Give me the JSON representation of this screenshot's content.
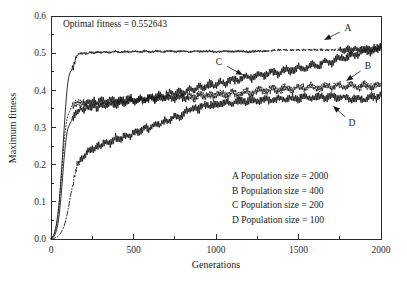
{
  "chart_data": {
    "type": "line",
    "title": "",
    "xlabel": "Generations",
    "ylabel": "Maximum fitness",
    "xlim": [
      0,
      2000
    ],
    "ylim": [
      0.0,
      0.6
    ],
    "grid": false,
    "legend_position": "inside-lower-right",
    "xticks": [
      0,
      500,
      1000,
      1500,
      2000
    ],
    "xtick_labels": [
      "0",
      "500",
      "1000",
      "1500",
      "2000"
    ],
    "xminor_step": 250,
    "yticks": [
      0.0,
      0.1,
      0.2,
      0.3,
      0.4,
      0.5,
      0.6
    ],
    "ytick_labels": [
      "0.0",
      "0.1",
      "0.2",
      "0.3",
      "0.4",
      "0.5",
      "0.6"
    ],
    "yminor_step": 0.05,
    "annotations": [
      {
        "name": "optimal-fitness-note",
        "text": "Optimal fitness = 0.552643",
        "x": 120,
        "y": 0.575
      }
    ],
    "series": [
      {
        "name": "A",
        "label": "A Population size = 2000",
        "population_size": 2000,
        "linestyle": "solid-then-dashed",
        "color": "#1a1a1a",
        "final_value": 0.515,
        "plateau_value": 0.505,
        "x": [
          0,
          10,
          20,
          30,
          40,
          50,
          60,
          70,
          80,
          90,
          100,
          110,
          120,
          130,
          140,
          150,
          160,
          170,
          180,
          200,
          220,
          240,
          260,
          280,
          300,
          330,
          360,
          390,
          420,
          450,
          480,
          510,
          540,
          570,
          600,
          640,
          680,
          720,
          760,
          800,
          840,
          880,
          920,
          960,
          1000,
          1050,
          1100,
          1150,
          1200,
          1250,
          1300,
          1350,
          1400,
          1450,
          1500,
          1550,
          1600,
          1650,
          1700,
          1750,
          1780,
          1800,
          1820,
          1840,
          1860,
          1880,
          1900,
          1920,
          1940,
          1960,
          1980,
          2000
        ],
        "y": [
          0.002,
          0.006,
          0.015,
          0.032,
          0.06,
          0.1,
          0.16,
          0.225,
          0.3,
          0.365,
          0.415,
          0.442,
          0.452,
          0.455,
          0.47,
          0.487,
          0.494,
          0.498,
          0.5,
          0.5,
          0.498,
          0.503,
          0.5,
          0.504,
          0.501,
          0.504,
          0.502,
          0.505,
          0.502,
          0.505,
          0.503,
          0.505,
          0.503,
          0.506,
          0.503,
          0.506,
          0.503,
          0.506,
          0.504,
          0.506,
          0.503,
          0.506,
          0.504,
          0.506,
          0.503,
          0.506,
          0.504,
          0.506,
          0.503,
          0.506,
          0.505,
          0.508,
          0.509,
          0.509,
          0.509,
          0.509,
          0.509,
          0.509,
          0.509,
          0.509,
          0.507,
          0.512,
          0.506,
          0.514,
          0.507,
          0.515,
          0.508,
          0.516,
          0.509,
          0.517,
          0.509,
          0.516
        ]
      },
      {
        "name": "B",
        "label": "B Population size = 400",
        "population_size": 400,
        "linestyle": "dotted-dashdot",
        "color": "#1a1a1a",
        "final_value": 0.412,
        "x": [
          0,
          10,
          20,
          30,
          40,
          50,
          60,
          70,
          80,
          90,
          100,
          120,
          140,
          160,
          180,
          200,
          220,
          240,
          260,
          280,
          300,
          330,
          360,
          390,
          420,
          450,
          480,
          510,
          540,
          570,
          600,
          630,
          660,
          690,
          720,
          750,
          780,
          810,
          840,
          870,
          900,
          930,
          960,
          990,
          1020,
          1060,
          1100,
          1140,
          1180,
          1220,
          1260,
          1300,
          1340,
          1380,
          1420,
          1460,
          1500,
          1540,
          1580,
          1620,
          1660,
          1700,
          1740,
          1780,
          1820,
          1860,
          1900,
          1940,
          1970,
          2000
        ],
        "y": [
          0.001,
          0.004,
          0.012,
          0.028,
          0.055,
          0.095,
          0.15,
          0.21,
          0.265,
          0.305,
          0.33,
          0.352,
          0.362,
          0.365,
          0.368,
          0.362,
          0.372,
          0.365,
          0.374,
          0.366,
          0.375,
          0.368,
          0.376,
          0.369,
          0.378,
          0.37,
          0.379,
          0.371,
          0.38,
          0.372,
          0.382,
          0.372,
          0.383,
          0.374,
          0.384,
          0.375,
          0.386,
          0.376,
          0.388,
          0.378,
          0.39,
          0.379,
          0.392,
          0.382,
          0.394,
          0.384,
          0.396,
          0.386,
          0.4,
          0.39,
          0.404,
          0.394,
          0.407,
          0.397,
          0.41,
          0.4,
          0.412,
          0.402,
          0.414,
          0.403,
          0.415,
          0.404,
          0.416,
          0.405,
          0.417,
          0.406,
          0.418,
          0.406,
          0.416,
          0.412
        ]
      },
      {
        "name": "C",
        "label": "C Population size = 200",
        "population_size": 200,
        "linestyle": "solid",
        "color": "#1a1a1a",
        "final_value": 0.518,
        "x": [
          0,
          10,
          20,
          30,
          40,
          50,
          60,
          70,
          80,
          90,
          100,
          120,
          140,
          160,
          180,
          200,
          220,
          240,
          260,
          280,
          300,
          330,
          360,
          390,
          420,
          450,
          480,
          510,
          540,
          570,
          600,
          630,
          660,
          690,
          720,
          750,
          780,
          810,
          840,
          870,
          900,
          930,
          960,
          990,
          1020,
          1060,
          1100,
          1140,
          1180,
          1220,
          1260,
          1300,
          1340,
          1380,
          1420,
          1460,
          1500,
          1540,
          1580,
          1620,
          1660,
          1700,
          1740,
          1780,
          1820,
          1860,
          1900,
          1940,
          1970,
          2000
        ],
        "y": [
          0.001,
          0.003,
          0.008,
          0.018,
          0.035,
          0.065,
          0.11,
          0.165,
          0.22,
          0.265,
          0.295,
          0.315,
          0.33,
          0.342,
          0.35,
          0.345,
          0.356,
          0.35,
          0.36,
          0.352,
          0.362,
          0.356,
          0.366,
          0.358,
          0.37,
          0.362,
          0.374,
          0.366,
          0.378,
          0.37,
          0.384,
          0.376,
          0.39,
          0.382,
          0.396,
          0.388,
          0.4,
          0.392,
          0.406,
          0.398,
          0.412,
          0.404,
          0.418,
          0.41,
          0.424,
          0.416,
          0.432,
          0.424,
          0.44,
          0.43,
          0.446,
          0.438,
          0.452,
          0.444,
          0.458,
          0.45,
          0.464,
          0.456,
          0.472,
          0.464,
          0.48,
          0.472,
          0.49,
          0.484,
          0.5,
          0.494,
          0.508,
          0.5,
          0.512,
          0.518
        ]
      },
      {
        "name": "D",
        "label": "D Population size = 100",
        "population_size": 100,
        "linestyle": "dashdot",
        "color": "#1a1a1a",
        "final_value": 0.392,
        "x": [
          0,
          20,
          40,
          60,
          80,
          100,
          120,
          140,
          160,
          180,
          200,
          220,
          240,
          260,
          280,
          300,
          330,
          360,
          390,
          420,
          450,
          480,
          510,
          540,
          570,
          600,
          630,
          660,
          690,
          720,
          750,
          780,
          810,
          840,
          870,
          900,
          930,
          960,
          990,
          1020,
          1060,
          1100,
          1140,
          1180,
          1220,
          1260,
          1300,
          1340,
          1380,
          1420,
          1460,
          1500,
          1540,
          1580,
          1620,
          1660,
          1700,
          1740,
          1780,
          1820,
          1860,
          1900,
          1940,
          1970,
          2000
        ],
        "y": [
          0.0,
          0.002,
          0.006,
          0.016,
          0.035,
          0.07,
          0.12,
          0.165,
          0.2,
          0.212,
          0.222,
          0.232,
          0.244,
          0.24,
          0.254,
          0.248,
          0.262,
          0.256,
          0.272,
          0.266,
          0.282,
          0.276,
          0.292,
          0.286,
          0.302,
          0.296,
          0.312,
          0.306,
          0.322,
          0.316,
          0.332,
          0.326,
          0.342,
          0.348,
          0.354,
          0.35,
          0.362,
          0.356,
          0.366,
          0.36,
          0.37,
          0.364,
          0.374,
          0.368,
          0.376,
          0.37,
          0.378,
          0.372,
          0.38,
          0.374,
          0.382,
          0.376,
          0.384,
          0.377,
          0.385,
          0.378,
          0.386,
          0.378,
          0.384,
          0.374,
          0.382,
          0.372,
          0.384,
          0.378,
          0.392
        ]
      }
    ],
    "series_callouts": [
      {
        "name": "A",
        "label": "A",
        "label_x": 348,
        "label_y": 28,
        "tip_x": 324,
        "tip_y": 40
      },
      {
        "name": "B",
        "label": "B",
        "label_x": 368,
        "label_y": 66,
        "tip_x": 346,
        "tip_y": 81
      },
      {
        "name": "C",
        "label": "C",
        "label_x": 219,
        "label_y": 62,
        "tip_x": 243,
        "tip_y": 75
      },
      {
        "name": "D",
        "label": "D",
        "label_x": 352,
        "label_y": 123,
        "tip_x": 333,
        "tip_y": 106
      }
    ]
  }
}
